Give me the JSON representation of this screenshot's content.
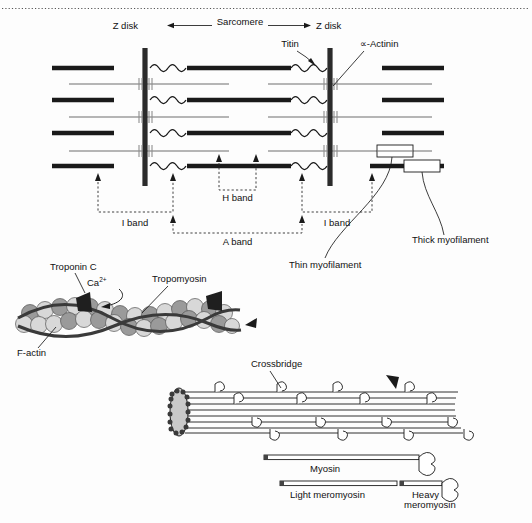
{
  "figure": {
    "labels": {
      "z_disk_left": "Z disk",
      "z_disk_right": "Z disk",
      "sarcomere": "Sarcomere",
      "titin": "Titin",
      "actinin": "∝-Actinin",
      "h_band": "H band",
      "i_band_left": "I band",
      "i_band_right": "I band",
      "a_band": "A band",
      "thin_myofilament": "Thin myofilament",
      "thick_myofilament": "Thick myofilament",
      "troponin_c": "Troponin C",
      "calcium": "Ca",
      "calcium_charge": "2+",
      "tropomyosin": "Tropomyosin",
      "f_actin": "F-actin",
      "crossbridge": "Crossbridge",
      "myosin": "Myosin",
      "light_meromyosin": "Light meromyosin",
      "heavy_meromyosin_line1": "Heavy",
      "heavy_meromyosin_line2": "meromyosin"
    },
    "colors": {
      "thick_filament": "#1a1a1a",
      "thin_filament": "#6e6e6e",
      "z_disk": "#2b2b2b",
      "actin_bead_light": "#d8d8d8",
      "actin_bead_mid": "#9a9a9a",
      "tropomyosin_strand": "#3a3a3a",
      "troponin": "#1f1f1f",
      "background": "#fdfdfd"
    },
    "geometry": {
      "z_disk_left_x": 145,
      "z_disk_right_x": 330,
      "z_disk_top_y": 48,
      "z_disk_bottom_y": 186,
      "thick_rows_y": [
        68,
        100,
        133,
        166
      ],
      "thin_rows_y": [
        84,
        117,
        151
      ],
      "h_band_left_x": 219,
      "h_band_right_x": 256,
      "a_band_left_x": 173,
      "a_band_right_x": 302,
      "i_band_left_from_x": 98,
      "i_band_left_to_x": 173,
      "i_band_right_from_x": 302,
      "i_band_right_to_x": 372
    }
  }
}
